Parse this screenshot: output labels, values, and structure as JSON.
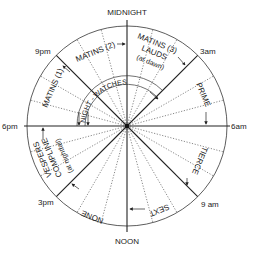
{
  "diagram": {
    "colors": {
      "line": "#222222",
      "dotted": "#555555",
      "background": "#ffffff"
    },
    "hour_labels": {
      "midnight": "MIDNIGHT",
      "noon": "NOON",
      "am3": "3am",
      "am6": "6am",
      "am9": "9 am",
      "pm3": "3pm",
      "pm6": "6pm",
      "pm9": "9pm"
    },
    "offices": {
      "matins1": "MATINS (1)",
      "matins2": "MATINS (2)",
      "matins3": "MATINS (3)",
      "lauds": "LAUDS",
      "lauds_note": "(at dawn)",
      "prime": "PRIME",
      "tierce": "TIERCE",
      "sext": "SEXT",
      "none": "NONE",
      "vespers": "VESPERS",
      "compline": "COMPLINE",
      "compline_note": "(at nightfall)",
      "night_watches": "NIGHT - WATCHES"
    }
  }
}
